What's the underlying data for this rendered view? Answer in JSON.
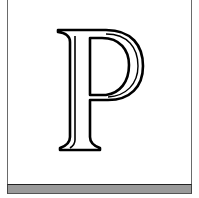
{
  "initial_cap": {
    "letter": "P",
    "style": "outlined-serif",
    "stroke_color": "#000000",
    "fill_color": "#ffffff"
  },
  "frame": {
    "border_color": "#6a6a6a",
    "background": "#ffffff"
  },
  "footer_bar": {
    "color": "#9a9a9a"
  }
}
